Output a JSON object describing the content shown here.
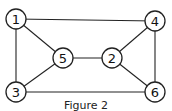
{
  "diagram": {
    "caption": "Figure 2",
    "nodes": [
      {
        "id": "1",
        "label": "1",
        "x": 16,
        "y": 19
      },
      {
        "id": "4",
        "label": "4",
        "x": 155,
        "y": 21
      },
      {
        "id": "5",
        "label": "5",
        "x": 63,
        "y": 58
      },
      {
        "id": "2",
        "label": "2",
        "x": 112,
        "y": 58
      },
      {
        "id": "3",
        "label": "3",
        "x": 16,
        "y": 92
      },
      {
        "id": "6",
        "label": "6",
        "x": 155,
        "y": 92
      }
    ],
    "edges": [
      [
        "1",
        "4"
      ],
      [
        "1",
        "5"
      ],
      [
        "1",
        "3"
      ],
      [
        "5",
        "2"
      ],
      [
        "5",
        "3"
      ],
      [
        "2",
        "4"
      ],
      [
        "2",
        "6"
      ],
      [
        "4",
        "6"
      ],
      [
        "3",
        "6"
      ]
    ]
  }
}
